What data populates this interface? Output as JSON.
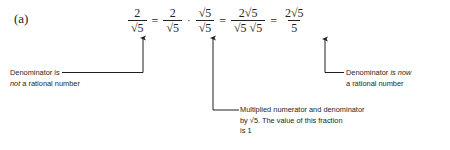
{
  "figure": {
    "part_label": "(a)",
    "background_color": "#ffffff",
    "ink_color": "#231f20"
  },
  "equation": {
    "description": "Rationalizing the denominator of 2 over root 5",
    "terms": [
      {
        "type": "fraction",
        "numerator": "2",
        "denominator": "√5"
      },
      {
        "type": "operator",
        "symbol": "="
      },
      {
        "type": "fraction",
        "numerator": "2",
        "denominator": "√5"
      },
      {
        "type": "operator",
        "symbol": "·"
      },
      {
        "type": "fraction",
        "numerator": "√5",
        "denominator": "√5"
      },
      {
        "type": "operator",
        "symbol": "="
      },
      {
        "type": "fraction",
        "numerator": "2√5",
        "denominator": "√5 √5"
      },
      {
        "type": "operator",
        "symbol": "="
      },
      {
        "type": "fraction",
        "numerator": "2√5",
        "denominator": "5"
      }
    ],
    "symbols": {
      "equals": "=",
      "multiply_dot": "·",
      "radical": "√",
      "two": "2",
      "five": "5",
      "root_five": "√5",
      "two_root_five": "2√5",
      "root_five_times_root_five": "√5 √5"
    }
  },
  "annotations": [
    {
      "id": "left",
      "name": "denominator-not-rational-callout",
      "lines": [
        {
          "segments": [
            {
              "text": "Denominator is",
              "italic": false
            }
          ]
        },
        {
          "segments": [
            {
              "text": "not",
              "italic": true
            },
            {
              "text": " a rational number",
              "italic": false
            }
          ]
        }
      ],
      "points_to": "denominator √5 of first fraction"
    },
    {
      "id": "mid",
      "name": "multiplied-by-one-callout",
      "lines": [
        {
          "segments": [
            {
              "text": "Multiplied numerator and denominator",
              "italic": false
            }
          ]
        },
        {
          "segments": [
            {
              "text": "by √5. The value of this fraction",
              "italic": false
            }
          ]
        },
        {
          "segments": [
            {
              "text": "is 1",
              "italic": false
            }
          ]
        }
      ],
      "points_to": "the fraction √5 over √5"
    },
    {
      "id": "right",
      "name": "denominator-now-rational-callout",
      "lines": [
        {
          "segments": [
            {
              "text": "Denominator ",
              "italic": false
            },
            {
              "text": "is now",
              "italic": true
            }
          ]
        },
        {
          "segments": [
            {
              "text": "a rational number",
              "italic": false
            }
          ]
        }
      ],
      "points_to": "denominator 5 of final fraction"
    }
  ]
}
